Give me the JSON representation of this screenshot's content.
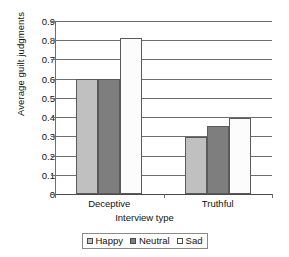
{
  "chart_data": {
    "type": "bar",
    "title": "",
    "xlabel": "Interview type",
    "ylabel": "Average guilt judgments",
    "categories": [
      "Deceptive",
      "Truthful"
    ],
    "series": [
      {
        "name": "Happy",
        "values": [
          0.6,
          0.295
        ],
        "color": "#c0c0c0"
      },
      {
        "name": "Neutral",
        "values": [
          0.6,
          0.355
        ],
        "color": "#7e7e7e"
      },
      {
        "name": "Sad",
        "values": [
          0.81,
          0.395
        ],
        "color": "#ffffff"
      }
    ],
    "ylim": [
      0,
      0.9
    ],
    "ytick_values": [
      0,
      0.1,
      0.2,
      0.3,
      0.4,
      0.5,
      0.6,
      0.7,
      0.8,
      0.9
    ],
    "ytick_labels": [
      "0",
      "0.1",
      "0.2",
      "0.3",
      "0.4",
      "0.5",
      "0.6",
      "0.7",
      "0.8",
      "0.9"
    ],
    "grid": "horizontal",
    "legend_position": "bottom-center",
    "legend_entries": [
      "Happy",
      "Neutral",
      "Sad"
    ]
  },
  "axes": {
    "y_title": "Average guilt judgments",
    "x_title": "Interview type"
  },
  "colors": {
    "happy": "#c0c0c0",
    "neutral": "#7e7e7e",
    "sad": "#ffffff",
    "grid": "#6e6e6e",
    "bar_outline": "#5a5a5a",
    "text": "#111111",
    "background": "#ffffff"
  }
}
